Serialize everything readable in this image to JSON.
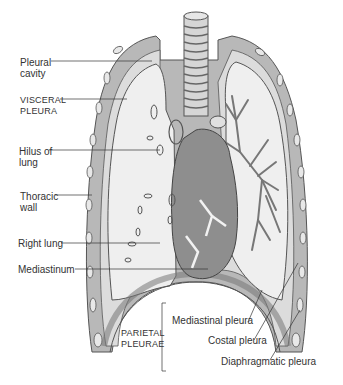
{
  "diagram": {
    "colors": {
      "background": "#ffffff",
      "lung_fill": "#ececec",
      "pleura_band": "#a9a9a9",
      "heart": "#8e8e8e",
      "line": "#444444"
    },
    "labels": {
      "pleural_cavity": "Pleural\ncavity",
      "visceral_pleura": "VISCERAL\nPLEURA",
      "hilus_of_lung": "Hilus of\nlung",
      "thoracic_wall": "Thoracic\nwall",
      "right_lung": "Right lung",
      "mediastinum": "Mediastinum",
      "parietal_pleurae": "PARIETAL\nPLEURAE",
      "mediastinal_pleura": "Mediastinal pleura",
      "costal_pleura": "Costal pleura",
      "diaphragmatic_pleura": "Diaphragmatic pleura"
    }
  }
}
